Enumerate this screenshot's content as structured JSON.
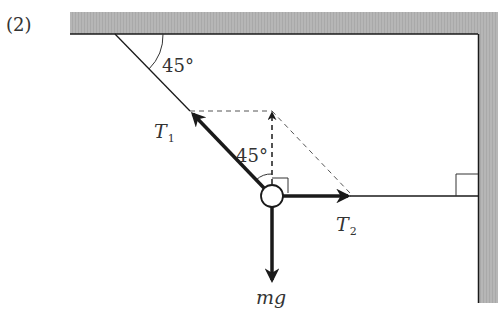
{
  "problem_number": "(2)",
  "angles": {
    "ceiling_angle": "45°",
    "vertical_angle": "45°"
  },
  "forces": {
    "t1": {
      "symbol": "T",
      "subscript": "1"
    },
    "t2": {
      "symbol": "T",
      "subscript": "2"
    },
    "weight": "mg"
  },
  "colors": {
    "wall_fill": "#b4b4b4",
    "line": "#1a1a1a",
    "dashed": "#555555"
  }
}
